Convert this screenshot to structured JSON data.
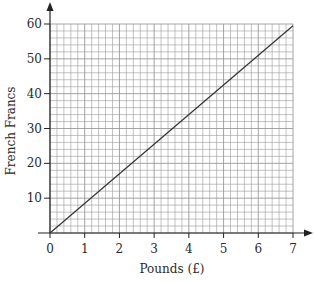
{
  "chart_data": {
    "type": "line",
    "title": "",
    "xlabel": "Pounds (£)",
    "ylabel": "French Francs",
    "xlim": [
      0,
      7
    ],
    "ylim": [
      0,
      60
    ],
    "x_ticks": [
      0,
      1,
      2,
      3,
      4,
      5,
      6,
      7
    ],
    "y_ticks": [
      10,
      20,
      30,
      40,
      50,
      60
    ],
    "x_tick_labels": [
      "0",
      "1",
      "2",
      "3",
      "4",
      "5",
      "6",
      "7"
    ],
    "y_tick_labels": [
      "10",
      "20",
      "30",
      "40",
      "50",
      "60"
    ],
    "grid": true,
    "minor_grid_x_step": 0.2,
    "minor_grid_y_step": 2,
    "legend": null,
    "series": [
      {
        "name": "Conversion line",
        "x": [
          0,
          7
        ],
        "y": [
          0,
          59.5
        ]
      }
    ],
    "colors": {
      "grid": "#9a9a9a",
      "axis": "#222222",
      "line": "#333333"
    }
  }
}
